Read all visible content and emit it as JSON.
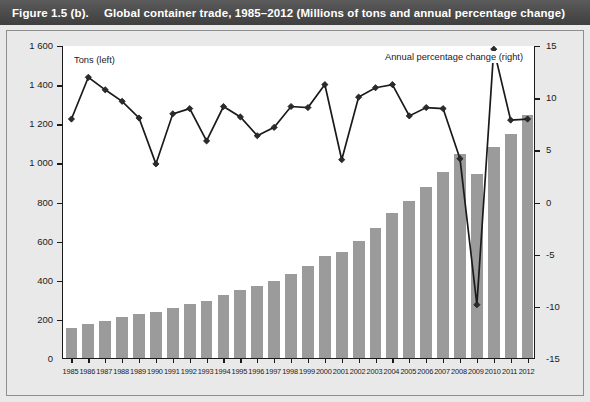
{
  "header": {
    "figure_label": "Figure 1.5 (b).",
    "title": "Global container trade, 1985–2012 (Millions of tons and annual percentage change)"
  },
  "legend": {
    "bars_label": "Tons (left)",
    "line_label": "Annual percentage change (right)"
  },
  "axes": {
    "left_ticks": [
      "1 600",
      "1 400",
      "1 200",
      "1 000",
      "800",
      "600",
      "400",
      "200",
      "0"
    ],
    "right_ticks": [
      "15",
      "10",
      "5",
      "0",
      "-5",
      "-10",
      "-15"
    ],
    "left_label": "",
    "right_label": ""
  },
  "chart_data": {
    "type": "bar",
    "title": "Global container trade, 1985–2012 (Millions of tons and annual percentage change)",
    "xlabel": "",
    "ylabel": "Millions of tons",
    "y2label": "Annual percentage change",
    "ylim": [
      0,
      1600
    ],
    "y2lim": [
      -15,
      15
    ],
    "grid": false,
    "legend_position": "inside-top",
    "categories": [
      "1985",
      "1986",
      "1987",
      "1988",
      "1989",
      "1990",
      "1991",
      "1992",
      "1993",
      "1994",
      "1995",
      "1996",
      "1997",
      "1998",
      "1999",
      "2000",
      "2001",
      "2002",
      "2003",
      "2004",
      "2005",
      "2006",
      "2007",
      "2008",
      "2009",
      "2010",
      "2011",
      "2012"
    ],
    "series": [
      {
        "name": "Tons (left)",
        "type": "bar",
        "axis": "left",
        "unit": "millions of tons",
        "values": [
          152,
          172,
          191,
          209,
          226,
          234,
          254,
          277,
          293,
          320,
          346,
          368,
          394,
          430,
          468,
          521,
          543,
          598,
          664,
          740,
          801,
          874,
          953,
          1042,
          940,
          1078,
          1147,
          1240
        ]
      },
      {
        "name": "Annual percentage change (right)",
        "type": "line",
        "axis": "right",
        "unit": "percent",
        "values": [
          8.0,
          12.0,
          10.8,
          9.7,
          8.1,
          3.7,
          8.5,
          9.0,
          5.9,
          9.2,
          8.2,
          6.4,
          7.2,
          9.2,
          9.1,
          11.3,
          4.1,
          10.1,
          11.0,
          11.3,
          8.3,
          9.1,
          9.0,
          4.2,
          -9.8,
          14.7,
          7.9,
          8.0
        ]
      }
    ]
  }
}
